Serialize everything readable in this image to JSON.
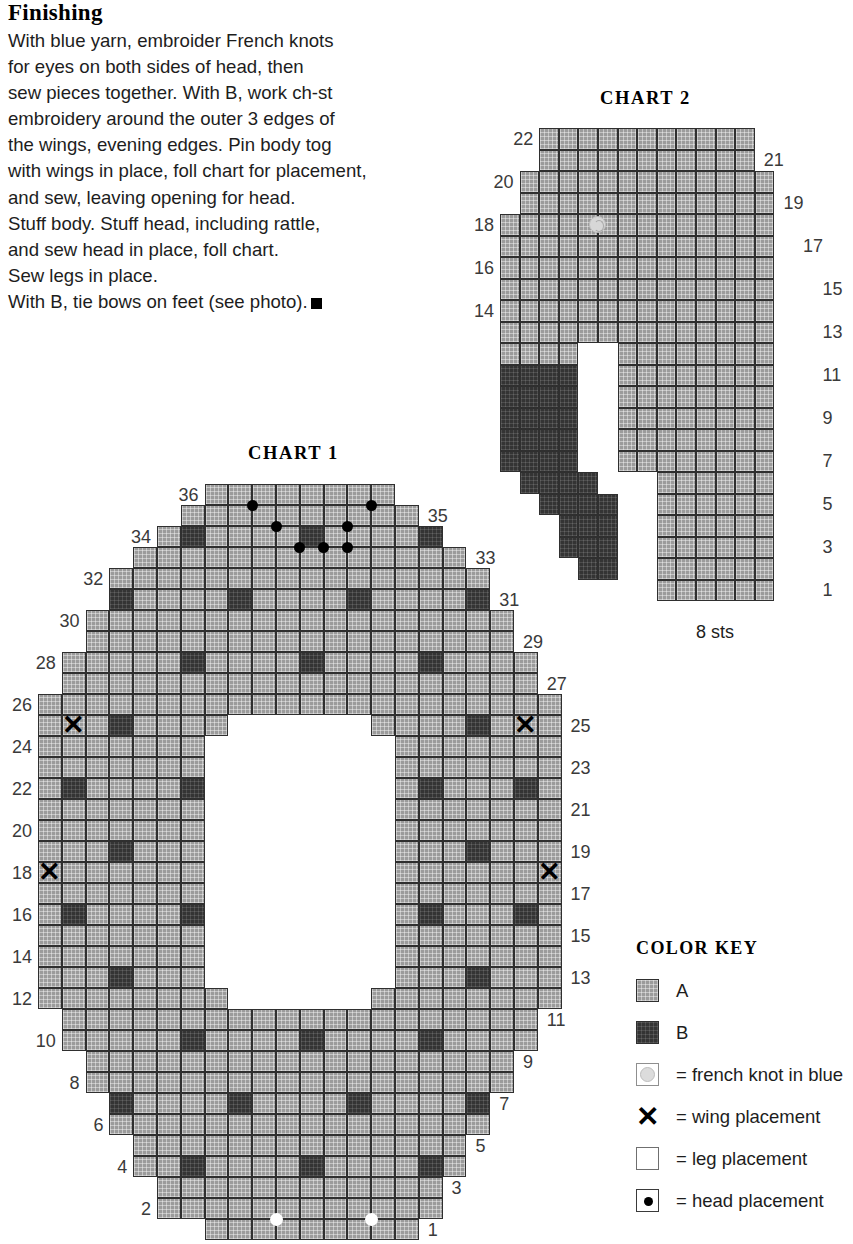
{
  "finishing": {
    "heading": "Finishing",
    "lines": [
      "With blue yarn, embroider French knots",
      "for eyes on both sides of head, then",
      "sew pieces together. With B, work ch-st",
      "embroidery around the outer 3 edges of",
      "the wings, evening edges. Pin body tog",
      "with wings in place, foll chart for placement,",
      "and sew, leaving opening for head.",
      "Stuff body. Stuff head, including rattle,",
      "and sew head in place, foll chart.",
      "Sew legs in place.",
      "With B, tie bows on feet (see photo)."
    ]
  },
  "chart1": {
    "title": "CHART 1",
    "cols": 22,
    "rows": 36,
    "left_row_numbers": [
      "36",
      "34",
      "32",
      "30",
      "28",
      "26",
      "24",
      "22",
      "20",
      "18",
      "16",
      "14",
      "12",
      "10",
      "8",
      "6",
      "4",
      "2"
    ],
    "right_row_numbers": [
      "35",
      "33",
      "31",
      "29",
      "27",
      "25",
      "23",
      "21",
      "19",
      "17",
      "15",
      "13",
      "11",
      "9",
      "7",
      "5",
      "3",
      "1"
    ],
    "row_spans": [
      {
        "row": 36,
        "start": 7,
        "end": 15
      },
      {
        "row": 35,
        "start": 6,
        "end": 16
      },
      {
        "row": 34,
        "start": 5,
        "end": 17
      },
      {
        "row": 33,
        "start": 4,
        "end": 18
      },
      {
        "row": 32,
        "start": 3,
        "end": 19
      },
      {
        "row": 31,
        "start": 3,
        "end": 19
      },
      {
        "row": 30,
        "start": 2,
        "end": 20
      },
      {
        "row": 29,
        "start": 2,
        "end": 20
      },
      {
        "row": 28,
        "start": 1,
        "end": 21
      },
      {
        "row": 27,
        "start": 1,
        "end": 21
      },
      {
        "row": 26,
        "start": 0,
        "end": 22
      },
      {
        "row": 25,
        "start": 0,
        "end": 22
      },
      {
        "row": 24,
        "start": 0,
        "end": 22
      },
      {
        "row": 23,
        "start": 0,
        "end": 22
      },
      {
        "row": 22,
        "start": 0,
        "end": 22
      },
      {
        "row": 21,
        "start": 0,
        "end": 22
      },
      {
        "row": 20,
        "start": 0,
        "end": 22
      },
      {
        "row": 19,
        "start": 0,
        "end": 22
      },
      {
        "row": 18,
        "start": 0,
        "end": 22
      },
      {
        "row": 17,
        "start": 0,
        "end": 22
      },
      {
        "row": 16,
        "start": 0,
        "end": 22
      },
      {
        "row": 15,
        "start": 0,
        "end": 22
      },
      {
        "row": 14,
        "start": 0,
        "end": 22
      },
      {
        "row": 13,
        "start": 0,
        "end": 22
      },
      {
        "row": 12,
        "start": 0,
        "end": 22
      },
      {
        "row": 11,
        "start": 1,
        "end": 21
      },
      {
        "row": 10,
        "start": 1,
        "end": 21
      },
      {
        "row": 9,
        "start": 2,
        "end": 20
      },
      {
        "row": 8,
        "start": 2,
        "end": 20
      },
      {
        "row": 7,
        "start": 3,
        "end": 19
      },
      {
        "row": 6,
        "start": 3,
        "end": 19
      },
      {
        "row": 5,
        "start": 4,
        "end": 18
      },
      {
        "row": 4,
        "start": 4,
        "end": 18
      },
      {
        "row": 3,
        "start": 5,
        "end": 17
      },
      {
        "row": 2,
        "start": 5,
        "end": 17
      },
      {
        "row": 1,
        "start": 7,
        "end": 16
      }
    ],
    "leg_opening": [
      {
        "row": 25,
        "start": 8,
        "end": 14
      },
      {
        "row": 24,
        "start": 7,
        "end": 15
      },
      {
        "row": 23,
        "start": 7,
        "end": 15
      },
      {
        "row": 22,
        "start": 7,
        "end": 15
      },
      {
        "row": 21,
        "start": 7,
        "end": 15
      },
      {
        "row": 20,
        "start": 7,
        "end": 15
      },
      {
        "row": 19,
        "start": 7,
        "end": 15
      },
      {
        "row": 18,
        "start": 7,
        "end": 15
      },
      {
        "row": 17,
        "start": 7,
        "end": 15
      },
      {
        "row": 16,
        "start": 7,
        "end": 15
      },
      {
        "row": 15,
        "start": 7,
        "end": 15
      },
      {
        "row": 14,
        "start": 7,
        "end": 15
      },
      {
        "row": 13,
        "start": 7,
        "end": 15
      },
      {
        "row": 12,
        "start": 8,
        "end": 14
      }
    ],
    "b_cells": [
      {
        "row": 34,
        "col": 6
      },
      {
        "row": 34,
        "col": 16
      },
      {
        "row": 34,
        "col": 11
      },
      {
        "row": 31,
        "col": 3
      },
      {
        "row": 31,
        "col": 8
      },
      {
        "row": 31,
        "col": 13
      },
      {
        "row": 31,
        "col": 18
      },
      {
        "row": 28,
        "col": 6
      },
      {
        "row": 28,
        "col": 11
      },
      {
        "row": 28,
        "col": 16
      },
      {
        "row": 25,
        "col": 3
      },
      {
        "row": 25,
        "col": 18
      },
      {
        "row": 22,
        "col": 1
      },
      {
        "row": 22,
        "col": 6
      },
      {
        "row": 22,
        "col": 16
      },
      {
        "row": 22,
        "col": 20
      },
      {
        "row": 19,
        "col": 3
      },
      {
        "row": 19,
        "col": 18
      },
      {
        "row": 16,
        "col": 1
      },
      {
        "row": 16,
        "col": 6
      },
      {
        "row": 16,
        "col": 16
      },
      {
        "row": 16,
        "col": 20
      },
      {
        "row": 13,
        "col": 3
      },
      {
        "row": 13,
        "col": 18
      },
      {
        "row": 10,
        "col": 6
      },
      {
        "row": 10,
        "col": 11
      },
      {
        "row": 10,
        "col": 16
      },
      {
        "row": 7,
        "col": 3
      },
      {
        "row": 7,
        "col": 8
      },
      {
        "row": 7,
        "col": 13
      },
      {
        "row": 7,
        "col": 18
      },
      {
        "row": 4,
        "col": 6
      },
      {
        "row": 4,
        "col": 11
      },
      {
        "row": 4,
        "col": 16
      }
    ],
    "wing_placements": [
      {
        "row": 25,
        "col": 1
      },
      {
        "row": 25,
        "col": 20
      },
      {
        "row": 18,
        "col": 0
      },
      {
        "row": 18,
        "col": 21
      }
    ],
    "head_placements": [
      {
        "row": 36,
        "col": 8
      },
      {
        "row": 36,
        "col": 13
      },
      {
        "row": 35,
        "col": 9
      },
      {
        "row": 35,
        "col": 12
      },
      {
        "row": 34,
        "col": 10
      },
      {
        "row": 34,
        "col": 11
      },
      {
        "row": 34,
        "col": 12
      }
    ],
    "leg_markers": [
      {
        "row": 1,
        "col": 9
      },
      {
        "row": 1,
        "col": 13
      }
    ]
  },
  "chart2": {
    "title": "CHART 2",
    "cols": 14,
    "rows": 22,
    "sts_label": "8 sts",
    "left_row_numbers": [
      "22",
      "20",
      "18",
      "16",
      "14"
    ],
    "right_row_numbers": [
      "21",
      "19",
      "17",
      "15",
      "13",
      "11",
      "9",
      "7",
      "5",
      "3",
      "1"
    ],
    "row_spans": [
      {
        "row": 22,
        "start": 2,
        "end": 13
      },
      {
        "row": 21,
        "start": 2,
        "end": 13
      },
      {
        "row": 20,
        "start": 1,
        "end": 14
      },
      {
        "row": 19,
        "start": 1,
        "end": 14
      },
      {
        "row": 18,
        "start": 0,
        "end": 15
      },
      {
        "row": 17,
        "start": 0,
        "end": 15
      },
      {
        "row": 16,
        "start": 0,
        "end": 16
      },
      {
        "row": 15,
        "start": 0,
        "end": 16
      },
      {
        "row": 14,
        "start": 0,
        "end": 16
      },
      {
        "row": 13,
        "start": 0,
        "end": 16
      },
      {
        "row": 12,
        "start": 0,
        "end": 16
      },
      {
        "row": 11,
        "start": 0,
        "end": 16
      },
      {
        "row": 10,
        "start": 0,
        "end": 16
      },
      {
        "row": 9,
        "start": 0,
        "end": 16
      },
      {
        "row": 8,
        "start": 0,
        "end": 16
      },
      {
        "row": 7,
        "start": 0,
        "end": 16
      },
      {
        "row": 6,
        "start": 1,
        "end": 16
      },
      {
        "row": 5,
        "start": 2,
        "end": 16
      },
      {
        "row": 4,
        "start": 3,
        "end": 16
      },
      {
        "row": 3,
        "start": 3,
        "end": 16
      },
      {
        "row": 2,
        "start": 4,
        "end": 16
      },
      {
        "row": 1,
        "start": 8,
        "end": 16
      }
    ],
    "notch": [
      {
        "row": 12,
        "start": 4,
        "end": 6
      },
      {
        "row": 11,
        "start": 4,
        "end": 6
      },
      {
        "row": 10,
        "start": 4,
        "end": 6
      },
      {
        "row": 9,
        "start": 4,
        "end": 6
      },
      {
        "row": 8,
        "start": 4,
        "end": 6
      },
      {
        "row": 7,
        "start": 4,
        "end": 6
      },
      {
        "row": 6,
        "start": 5,
        "end": 8
      },
      {
        "row": 5,
        "start": 6,
        "end": 8
      },
      {
        "row": 4,
        "start": 6,
        "end": 8
      },
      {
        "row": 3,
        "start": 6,
        "end": 8
      },
      {
        "row": 2,
        "start": 6,
        "end": 8
      },
      {
        "row": 1,
        "start": 4,
        "end": 8
      }
    ],
    "b_region": [
      {
        "row": 11,
        "start": 0,
        "end": 4
      },
      {
        "row": 10,
        "start": 0,
        "end": 4
      },
      {
        "row": 9,
        "start": 0,
        "end": 4
      },
      {
        "row": 8,
        "start": 0,
        "end": 4
      },
      {
        "row": 7,
        "start": 0,
        "end": 4
      },
      {
        "row": 6,
        "start": 1,
        "end": 5
      },
      {
        "row": 5,
        "start": 2,
        "end": 6
      },
      {
        "row": 4,
        "start": 3,
        "end": 6
      },
      {
        "row": 3,
        "start": 3,
        "end": 6
      },
      {
        "row": 2,
        "start": 4,
        "end": 6
      }
    ],
    "french_knots": [
      {
        "row": 18,
        "col": 4
      }
    ]
  },
  "color_key": {
    "title": "COLOR KEY",
    "entries": [
      {
        "swatch": "a-swatch",
        "label": "A"
      },
      {
        "swatch": "b-swatch",
        "label": "B"
      },
      {
        "swatch": "french-knot-swatch",
        "label": "= french knot in blue"
      },
      {
        "swatch": "wing-placement-swatch",
        "label": "= wing placement"
      },
      {
        "swatch": "leg-placement-swatch",
        "label": "= leg placement"
      },
      {
        "swatch": "head-placement-swatch",
        "label": "= head placement"
      }
    ],
    "x_glyph": "✕"
  },
  "colors": {
    "yarn_a": "#9b9b9b",
    "yarn_b": "#343434",
    "grid_line": "#2f2f2f",
    "text": "#1d1d1d",
    "french_knot": "#d7d7d7"
  }
}
